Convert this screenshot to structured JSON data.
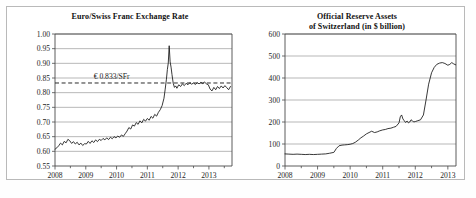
{
  "figure": {
    "background_color": "#ffffff",
    "frame_color": "#b9b9b9",
    "line_color": "#151515",
    "grid_color": "#9a9a9a"
  },
  "chart_data": [
    {
      "id": "euro-swiss-franc-exchange-rate",
      "type": "line",
      "title": "Euro/Swiss Franc Exchange Rate",
      "title_lines": [
        "Euro/Swiss Franc Exchange Rate"
      ],
      "xlabel": "",
      "ylabel": "",
      "xlim": [
        2008.0,
        2013.75
      ],
      "ylim": [
        0.55,
        1.0
      ],
      "grid": true,
      "legend": "none",
      "ytick_labels": [
        "1.00",
        "0.95",
        "0.90",
        "0.85",
        "0.80",
        "0.75",
        "0.70",
        "0.65",
        "0.60",
        "0.55"
      ],
      "ytick_values": [
        1.0,
        0.95,
        0.9,
        0.85,
        0.8,
        0.75,
        0.7,
        0.65,
        0.6,
        0.55
      ],
      "xtick_labels": [
        "2008",
        "2009",
        "2010",
        "2011",
        "2012",
        "2013"
      ],
      "xtick_values": [
        2008,
        2009,
        2010,
        2011,
        2012,
        2013
      ],
      "minor_xticks": [
        2008.5,
        2009.5,
        2010.5,
        2011.5,
        2012.5,
        2013.5
      ],
      "annotations": [
        {
          "name": "parity-reference",
          "text": "€ 0.833/SFr",
          "value": 0.833,
          "style": "dashed-horizontal-line"
        }
      ],
      "series": [
        {
          "name": "EUR per SFr",
          "x": [
            2008.0,
            2008.06,
            2008.12,
            2008.18,
            2008.24,
            2008.3,
            2008.36,
            2008.42,
            2008.48,
            2008.54,
            2008.6,
            2008.66,
            2008.72,
            2008.78,
            2008.84,
            2008.9,
            2008.96,
            2009.02,
            2009.08,
            2009.14,
            2009.2,
            2009.26,
            2009.32,
            2009.38,
            2009.44,
            2009.5,
            2009.56,
            2009.62,
            2009.68,
            2009.74,
            2009.8,
            2009.86,
            2009.92,
            2009.98,
            2010.04,
            2010.1,
            2010.16,
            2010.22,
            2010.28,
            2010.34,
            2010.4,
            2010.46,
            2010.52,
            2010.58,
            2010.64,
            2010.7,
            2010.76,
            2010.82,
            2010.88,
            2010.94,
            2011.0,
            2011.06,
            2011.12,
            2011.18,
            2011.24,
            2011.3,
            2011.36,
            2011.42,
            2011.48,
            2011.54,
            2011.58,
            2011.62,
            2011.65,
            2011.68,
            2011.71,
            2011.74,
            2011.77,
            2011.8,
            2011.84,
            2011.88,
            2011.92,
            2011.96,
            2012.02,
            2012.08,
            2012.14,
            2012.2,
            2012.26,
            2012.32,
            2012.38,
            2012.44,
            2012.5,
            2012.56,
            2012.62,
            2012.68,
            2012.74,
            2012.8,
            2012.86,
            2012.92,
            2012.98,
            2013.04,
            2013.1,
            2013.16,
            2013.22,
            2013.28,
            2013.34,
            2013.4,
            2013.46,
            2013.52,
            2013.58,
            2013.64,
            2013.7
          ],
          "y": [
            0.607,
            0.612,
            0.619,
            0.628,
            0.622,
            0.634,
            0.629,
            0.641,
            0.636,
            0.627,
            0.633,
            0.625,
            0.631,
            0.622,
            0.628,
            0.62,
            0.626,
            0.625,
            0.634,
            0.627,
            0.636,
            0.63,
            0.639,
            0.633,
            0.641,
            0.637,
            0.644,
            0.639,
            0.646,
            0.64,
            0.648,
            0.643,
            0.65,
            0.646,
            0.652,
            0.648,
            0.656,
            0.651,
            0.66,
            0.669,
            0.681,
            0.676,
            0.69,
            0.686,
            0.698,
            0.692,
            0.704,
            0.697,
            0.709,
            0.703,
            0.712,
            0.706,
            0.719,
            0.713,
            0.726,
            0.72,
            0.733,
            0.742,
            0.756,
            0.781,
            0.812,
            0.846,
            0.879,
            0.901,
            0.96,
            0.905,
            0.887,
            0.862,
            0.832,
            0.818,
            0.823,
            0.815,
            0.827,
            0.821,
            0.83,
            0.824,
            0.832,
            0.827,
            0.834,
            0.829,
            0.833,
            0.828,
            0.834,
            0.83,
            0.835,
            0.831,
            0.836,
            0.83,
            0.827,
            0.812,
            0.806,
            0.818,
            0.81,
            0.821,
            0.814,
            0.823,
            0.816,
            0.824,
            0.817,
            0.81,
            0.821
          ]
        }
      ]
    },
    {
      "id": "official-reserve-assets-switzerland",
      "type": "line",
      "title": "Official Reserve Assets of Switzerland (in $ billion)",
      "title_lines": [
        "Official Reserve Assets",
        "of Switzerland (in $ billion)"
      ],
      "xlabel": "",
      "ylabel": "",
      "xlim": [
        2008.0,
        2013.25
      ],
      "ylim": [
        0,
        600
      ],
      "grid": true,
      "legend": "none",
      "ytick_labels": [
        "600",
        "500",
        "400",
        "300",
        "200",
        "100",
        "0"
      ],
      "ytick_values": [
        600,
        500,
        400,
        300,
        200,
        100,
        0
      ],
      "xtick_labels": [
        "2008",
        "2009",
        "2010",
        "2011",
        "2012",
        "2013"
      ],
      "xtick_values": [
        2008,
        2009,
        2010,
        2011,
        2012,
        2013
      ],
      "minor_xticks": [
        2008.5,
        2009.5,
        2010.5,
        2011.5,
        2012.5
      ],
      "annotations": [],
      "series": [
        {
          "name": "Official reserve assets",
          "x": [
            2008.0,
            2008.12,
            2008.25,
            2008.37,
            2008.5,
            2008.62,
            2008.75,
            2008.87,
            2009.0,
            2009.12,
            2009.25,
            2009.37,
            2009.5,
            2009.58,
            2009.66,
            2009.75,
            2009.83,
            2009.91,
            2010.0,
            2010.08,
            2010.16,
            2010.25,
            2010.33,
            2010.41,
            2010.5,
            2010.58,
            2010.66,
            2010.75,
            2010.83,
            2010.91,
            2011.0,
            2011.08,
            2011.16,
            2011.25,
            2011.33,
            2011.41,
            2011.5,
            2011.54,
            2011.58,
            2011.62,
            2011.66,
            2011.7,
            2011.75,
            2011.79,
            2011.83,
            2011.87,
            2011.91,
            2011.95,
            2012.0,
            2012.08,
            2012.16,
            2012.25,
            2012.33,
            2012.41,
            2012.5,
            2012.58,
            2012.66,
            2012.75,
            2012.83,
            2012.91,
            2013.0,
            2013.06,
            2013.12,
            2013.18,
            2013.24
          ],
          "y": [
            55,
            54,
            53,
            54,
            53,
            52,
            53,
            52,
            53,
            54,
            55,
            58,
            62,
            80,
            92,
            95,
            96,
            97,
            99,
            102,
            108,
            118,
            128,
            136,
            146,
            152,
            158,
            152,
            155,
            160,
            164,
            166,
            170,
            172,
            176,
            180,
            196,
            224,
            232,
            214,
            206,
            198,
            204,
            196,
            200,
            210,
            206,
            200,
            202,
            206,
            210,
            232,
            300,
            372,
            424,
            448,
            462,
            468,
            470,
            466,
            458,
            462,
            470,
            464,
            460
          ]
        }
      ]
    }
  ]
}
